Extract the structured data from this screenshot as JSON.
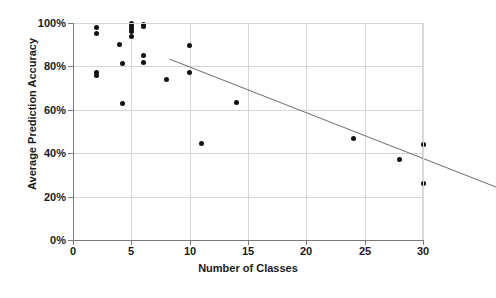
{
  "chart_data": {
    "type": "scatter",
    "title": "",
    "xlabel": "Number of Classes",
    "ylabel": "Average Prediction Accuracy",
    "xlim": [
      0,
      30
    ],
    "ylim": [
      0,
      100
    ],
    "grid": true,
    "legend": "none",
    "xticks": [
      0,
      5,
      10,
      15,
      20,
      25,
      30
    ],
    "xtick_labels": [
      "0",
      "5",
      "10",
      "15",
      "20",
      "25",
      "30"
    ],
    "yticks": [
      0,
      20,
      40,
      60,
      80,
      100
    ],
    "ytick_labels": [
      "0%",
      "20%",
      "40%",
      "60%",
      "80%",
      "100%"
    ],
    "y_unit": "percent",
    "marker": "filled-circle",
    "marker_color": "#111111",
    "points": [
      {
        "x": 2,
        "y": 98.0
      },
      {
        "x": 2,
        "y": 95.2
      },
      {
        "x": 2,
        "y": 77.0
      },
      {
        "x": 2,
        "y": 75.6
      },
      {
        "x": 4,
        "y": 90.0
      },
      {
        "x": 4.2,
        "y": 81.3
      },
      {
        "x": 4.2,
        "y": 62.8
      },
      {
        "x": 5,
        "y": 100.0
      },
      {
        "x": 5,
        "y": 98.8
      },
      {
        "x": 5,
        "y": 97.6
      },
      {
        "x": 5,
        "y": 96.3
      },
      {
        "x": 5,
        "y": 93.6
      },
      {
        "x": 6,
        "y": 99.2
      },
      {
        "x": 6,
        "y": 98.5
      },
      {
        "x": 6,
        "y": 85.0
      },
      {
        "x": 6,
        "y": 81.7
      },
      {
        "x": 8,
        "y": 74.0
      },
      {
        "x": 10,
        "y": 89.5
      },
      {
        "x": 10,
        "y": 77.0
      },
      {
        "x": 11,
        "y": 44.3
      },
      {
        "x": 14,
        "y": 63.5
      },
      {
        "x": 24,
        "y": 47.0
      },
      {
        "x": 28,
        "y": 37.2
      },
      {
        "x": 30,
        "y": 44.2
      },
      {
        "x": 30,
        "y": 26.0
      }
    ],
    "trendline": {
      "type": "linear",
      "color": "#6b6b6b",
      "x_start": 2,
      "y_start": 94.0,
      "x_end": 30,
      "y_end": 35.0
    }
  }
}
